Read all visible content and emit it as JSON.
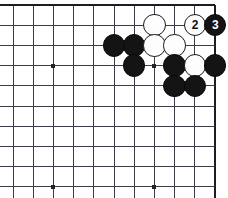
{
  "figure": {
    "kind": "go-board-diagram"
  },
  "board": {
    "columns": 11,
    "rows": 10,
    "cell_size": 20.2,
    "origin_x": 13,
    "origin_y": 5,
    "edges": {
      "top": true,
      "right": true,
      "left": false,
      "bottom": false
    },
    "line_color": "#3c3c46",
    "edge_color": "#1c1c22",
    "background_color": "#ffffff",
    "star_points": [
      {
        "col": 2,
        "row": 3
      },
      {
        "col": 7,
        "row": 3
      },
      {
        "col": 2,
        "row": 9
      },
      {
        "col": 7,
        "row": 9
      }
    ]
  },
  "stones": [
    {
      "id": "b1",
      "color": "black",
      "col": 5,
      "row": 2,
      "label": ""
    },
    {
      "id": "b2",
      "color": "black",
      "col": 6,
      "row": 2,
      "label": ""
    },
    {
      "id": "b3",
      "color": "black",
      "col": 6,
      "row": 3,
      "label": ""
    },
    {
      "id": "w1",
      "color": "white",
      "col": 7,
      "row": 1,
      "label": ""
    },
    {
      "id": "w2",
      "color": "white",
      "col": 7,
      "row": 2,
      "label": ""
    },
    {
      "id": "w3",
      "color": "white",
      "col": 8,
      "row": 2,
      "label": ""
    },
    {
      "id": "b4",
      "color": "black",
      "col": 8,
      "row": 3,
      "label": ""
    },
    {
      "id": "w4",
      "color": "white",
      "col": 9,
      "row": 3,
      "label": ""
    },
    {
      "id": "b5",
      "color": "black",
      "col": 10,
      "row": 3,
      "label": ""
    },
    {
      "id": "b6",
      "color": "black",
      "col": 8,
      "row": 4,
      "label": ""
    },
    {
      "id": "b7",
      "color": "black",
      "col": 9,
      "row": 4,
      "label": ""
    },
    {
      "id": "m2",
      "color": "white",
      "col": 9,
      "row": 1,
      "label": "2"
    },
    {
      "id": "m3",
      "color": "black",
      "col": 10,
      "row": 1,
      "label": "3"
    }
  ],
  "move_labels": {
    "move_2": "2",
    "move_3": "3"
  },
  "colors": {
    "black_stone": "#141414",
    "white_stone": "#fdfdfd",
    "stone_outline": "#1a1a1a",
    "grid": "#3c3c46",
    "board_bg": "#ffffff"
  }
}
